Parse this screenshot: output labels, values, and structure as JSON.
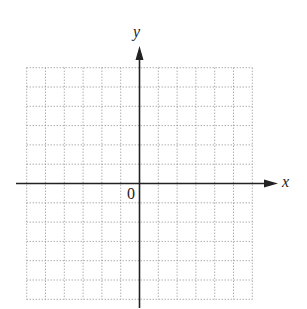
{
  "diagram": {
    "type": "coordinate-plane",
    "x_axis_label": "x",
    "y_axis_label": "y",
    "origin_label": "0",
    "grid": {
      "cells_left_of_origin": 6,
      "cells_right_of_origin": 6,
      "cells_above_origin": 6,
      "cells_below_origin": 6,
      "line_style": "dotted"
    },
    "colors": {
      "axis": "#222222",
      "grid": "#8a8a8a",
      "background": "#ffffff"
    }
  }
}
